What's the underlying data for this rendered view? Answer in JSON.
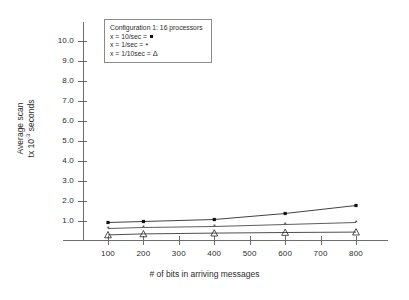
{
  "chart_data": {
    "type": "line",
    "title": "",
    "xlabel": "# of bits in arriving messages",
    "ylabel_line1": "Average scan",
    "ylabel_line2_prefix": "tx 10",
    "ylabel_line2_exp": "-3",
    "ylabel_line2_suffix": " seconds",
    "x": [
      100,
      200,
      400,
      600,
      800
    ],
    "xticks": [
      100,
      200,
      300,
      400,
      500,
      600,
      700,
      800
    ],
    "yticks": [
      "1.0",
      "2.0",
      "3.0",
      "4.0",
      "5.0",
      "6.0",
      "7.0",
      "8.0",
      "9.0",
      "10.0"
    ],
    "ytick_values": [
      1.0,
      2.0,
      3.0,
      4.0,
      5.0,
      6.0,
      7.0,
      8.0,
      9.0,
      10.0
    ],
    "xlim": [
      0,
      900
    ],
    "ylim": [
      0,
      10.6
    ],
    "grid": false,
    "legend_position": "top-left-inside",
    "series": [
      {
        "name": "x = 10/sec",
        "marker": "square",
        "color": "#111111",
        "values": [
          0.9,
          0.95,
          1.05,
          1.35,
          1.75
        ]
      },
      {
        "name": "x = 1/sec",
        "marker": "asterisk",
        "color": "#333333",
        "values": [
          0.6,
          0.65,
          0.7,
          0.8,
          0.9
        ]
      },
      {
        "name": "x = 1/10sec",
        "marker": "triangle",
        "color": "#222222",
        "values": [
          0.28,
          0.33,
          0.37,
          0.4,
          0.42
        ]
      }
    ]
  },
  "legend": {
    "title": "Configuration 1: 16 processors",
    "rows": [
      {
        "text": "x = 10/sec = ",
        "glyph": "square"
      },
      {
        "text": "x = 1/sec = ",
        "glyph": "asterisk"
      },
      {
        "text": "x = 1/10sec = ",
        "glyph": "triangle"
      }
    ]
  },
  "glyphs": {
    "asterisk": "*",
    "triangle": "Δ"
  },
  "colors": {
    "axis": "#6d6d6d",
    "text": "#2b2b2b",
    "series1": "#111111",
    "series2": "#333333",
    "series3": "#222222",
    "legend_border": "#8a8a8a",
    "background": "#ffffff"
  }
}
